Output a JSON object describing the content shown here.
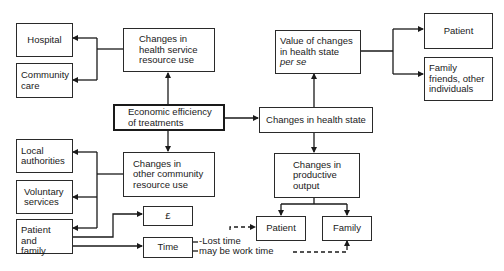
{
  "diagram": {
    "root": {
      "label": "Economic efficiency\nof treatments"
    },
    "branches": {
      "health_service": {
        "label": "Changes in\nhealth service\nresource use",
        "targets": [
          "Hospital",
          "Community\ncare"
        ]
      },
      "community": {
        "label": "Changes in\nother community\nresource use",
        "targets": [
          "Local\nauthorities",
          "Voluntary\nservices",
          "Patient and\nfamily"
        ]
      },
      "health_state": {
        "label": "Changes in health state",
        "value": {
          "label_line1": "Value of changes",
          "label_line2": "in health state",
          "label_line3": "per se",
          "targets": [
            "Patient",
            "Family\nfriends, other\nindividuals"
          ]
        },
        "productive": {
          "label": "Changes in\nproductive\noutput",
          "targets": [
            "Patient",
            "Family"
          ]
        }
      }
    },
    "patient_family_outputs": {
      "money": "£",
      "time": "Time"
    },
    "annotations": {
      "lost_time": "-Lost time",
      "work_time": "may  be work time"
    },
    "colors": {
      "line": "#1a1a1a",
      "background": "#ffffff"
    }
  }
}
